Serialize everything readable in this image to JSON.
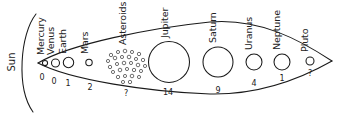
{
  "diagram": {
    "sun": {
      "label": "Sun",
      "icon": "sun-arc-icon"
    },
    "boundary": {
      "shape": "lens",
      "description": "almond shaped envelope narrowing to a point at right"
    },
    "moon_count_caption": "moons",
    "objects": [
      {
        "name": "Mercury",
        "label": "Mercury",
        "moons": "0",
        "cx": 45,
        "cy": 63,
        "r": 2.6,
        "kind": "planet"
      },
      {
        "name": "Venus",
        "label": "Venus",
        "moons": "0",
        "cx": 55.5,
        "cy": 63,
        "r": 4.0,
        "kind": "planet"
      },
      {
        "name": "Earth",
        "label": "Earth",
        "moons": "1",
        "cx": 68.5,
        "cy": 62.5,
        "r": 5.2,
        "kind": "planet"
      },
      {
        "name": "Mars",
        "label": "Mars",
        "moons": "2",
        "cx": 89,
        "cy": 62.5,
        "r": 3.2,
        "kind": "planet"
      },
      {
        "name": "Asteroids",
        "label": "Asteroids",
        "moons": "?",
        "cx": 126,
        "cy": 64,
        "r": 0,
        "kind": "belt"
      },
      {
        "name": "Jupiter",
        "label": "Jupiter",
        "moons": "14",
        "cx": 169,
        "cy": 62,
        "r": 20.5,
        "kind": "planet"
      },
      {
        "name": "Saturn",
        "label": "Saturn",
        "moons": "9",
        "cx": 218,
        "cy": 62,
        "r": 15.0,
        "kind": "planet"
      },
      {
        "name": "Uranus",
        "label": "Uranus",
        "moons": "4",
        "cx": 254,
        "cy": 62,
        "r": 8.0,
        "kind": "planet"
      },
      {
        "name": "Neptune",
        "label": "Neptune",
        "moons": "1",
        "cx": 282,
        "cy": 62,
        "r": 8.0,
        "kind": "planet"
      },
      {
        "name": "Pluto",
        "label": "Pluto",
        "moons": "?",
        "cx": 310,
        "cy": 61,
        "r": 4.0,
        "kind": "planet"
      }
    ],
    "colors": {
      "background": "#ffffff",
      "ink": "#1a1a1a",
      "text": "#222222"
    }
  }
}
